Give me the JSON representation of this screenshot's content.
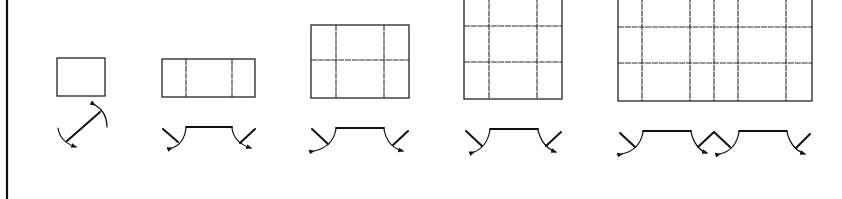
{
  "diagram": {
    "type": "architectural window elevation and plan-opening symbols",
    "colors": {
      "line": "#222222",
      "background": "#ffffff"
    },
    "left_border": {
      "x": 7
    },
    "items": [
      {
        "id": "window-1",
        "elevation": {
          "x": 57,
          "y": 58,
          "w": 48,
          "h": 38,
          "v_dividers": [],
          "h_dividers": []
        },
        "symbol": "single-pivot"
      },
      {
        "id": "window-2",
        "elevation": {
          "x": 162,
          "y": 59,
          "w": 93,
          "h": 38,
          "v_dividers": [
            186,
            232
          ],
          "h_dividers": []
        },
        "symbol": "twin-casement-with-fixed-center"
      },
      {
        "id": "window-3",
        "elevation": {
          "x": 311,
          "y": 25,
          "w": 98,
          "h": 73,
          "v_dividers": [
            336,
            384
          ],
          "h_dividers": [
            60
          ]
        },
        "symbol": "twin-casement-with-fixed-center"
      },
      {
        "id": "window-4",
        "elevation": {
          "x": 464,
          "y": -10,
          "w": 98,
          "h": 109,
          "v_dividers": [
            489,
            537
          ],
          "h_dividers": [
            26,
            62
          ]
        },
        "symbol": "twin-casement-with-fixed-center"
      },
      {
        "id": "window-5",
        "elevation": {
          "x": 618,
          "y": -10,
          "w": 194,
          "h": 111,
          "v_dividers": [
            642,
            690,
            714,
            738,
            786
          ],
          "h_dividers": [
            27,
            63
          ]
        },
        "symbol": "quad-casement-double-fixed"
      }
    ]
  }
}
